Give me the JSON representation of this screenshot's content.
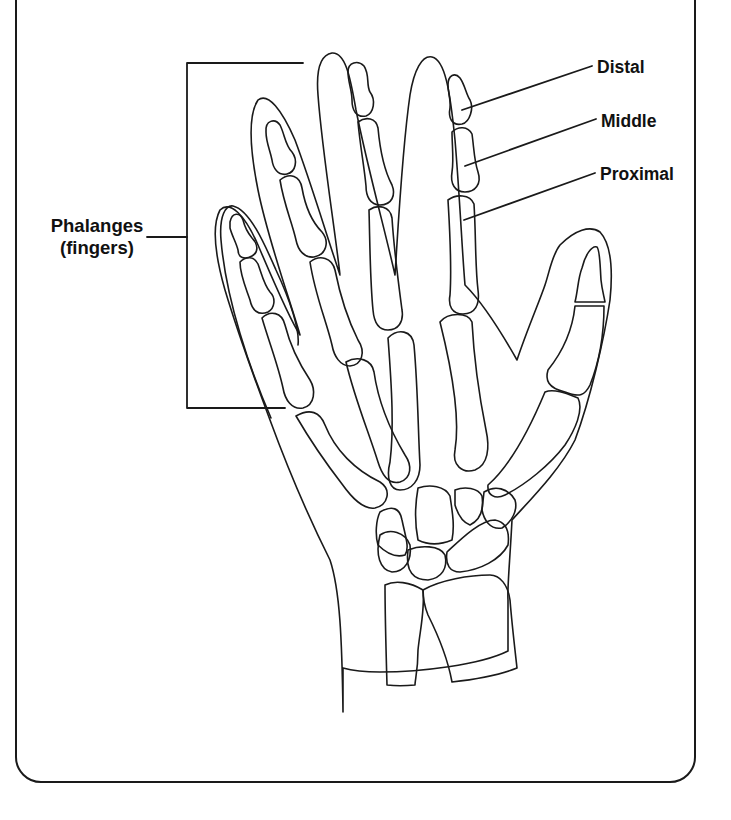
{
  "diagram": {
    "labels": {
      "phalanges_line1": "Phalanges",
      "phalanges_line2": "(fingers)",
      "distal": "Distal",
      "middle": "Middle",
      "proximal": "Proximal"
    },
    "colors": {
      "line": "#1a1a1a",
      "background": "#ffffff"
    }
  }
}
